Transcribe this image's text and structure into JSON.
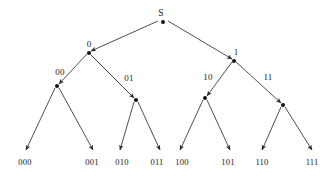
{
  "figure": {
    "name": "binary-prefix-code-tree",
    "background_color": "#ffffff",
    "stroke_color": "#3a3a3a",
    "text_color": "#1a1a1a"
  },
  "tree": {
    "root": {
      "id": "S",
      "label": "S",
      "label_x": 161,
      "label_y": 14,
      "x": 163,
      "y": 22
    },
    "internal_nodes": [
      {
        "id": "0",
        "label": "0",
        "label_x": 89,
        "label_y": 44,
        "x": 89,
        "y": 53
      },
      {
        "id": "1",
        "label": "1",
        "label_x": 236,
        "label_y": 52,
        "x": 234,
        "y": 61
      },
      {
        "id": "00",
        "label": "00",
        "label_x": 60,
        "label_y": 72,
        "x": 57,
        "y": 86
      },
      {
        "id": "01",
        "label": "01",
        "label_x": 129,
        "label_y": 78,
        "x": 136,
        "y": 100
      },
      {
        "id": "10",
        "label": "10",
        "label_x": 208,
        "label_y": 77,
        "x": 205,
        "y": 98
      },
      {
        "id": "11",
        "label": "11",
        "label_x": 268,
        "label_y": 77,
        "x": 283,
        "y": 105
      }
    ],
    "leaves": [
      {
        "id": "000",
        "label": "000",
        "label_x": 25,
        "label_y": 162,
        "tip_x": 26,
        "tip_y": 150
      },
      {
        "id": "001",
        "label": "001",
        "label_x": 92,
        "label_y": 162,
        "tip_x": 93,
        "tip_y": 150
      },
      {
        "id": "010",
        "label": "010",
        "label_x": 122,
        "label_y": 162,
        "tip_x": 120,
        "tip_y": 150
      },
      {
        "id": "011",
        "label": "011",
        "label_x": 157,
        "label_y": 162,
        "tip_x": 160,
        "tip_y": 150
      },
      {
        "id": "100",
        "label": "100",
        "label_x": 182,
        "label_y": 162,
        "tip_x": 180,
        "tip_y": 150
      },
      {
        "id": "101",
        "label": "101",
        "label_x": 228,
        "label_y": 162,
        "tip_x": 230,
        "tip_y": 150
      },
      {
        "id": "110",
        "label": "110",
        "label_x": 262,
        "label_y": 162,
        "tip_x": 262,
        "tip_y": 150
      },
      {
        "id": "111",
        "label": "111",
        "label_x": 312,
        "label_y": 162,
        "tip_x": 312,
        "tip_y": 150
      }
    ],
    "edges": [
      {
        "from": "S",
        "to": "0",
        "x1": 158,
        "y1": 21,
        "x2": 91,
        "y2": 51,
        "arrow": true
      },
      {
        "from": "S",
        "to": "1",
        "x1": 168,
        "y1": 21,
        "x2": 232,
        "y2": 59,
        "arrow": true
      },
      {
        "from": "0",
        "to": "00",
        "x1": 87,
        "y1": 54,
        "x2": 59,
        "y2": 84,
        "arrow": true
      },
      {
        "from": "0",
        "to": "01",
        "x1": 91,
        "y1": 55,
        "x2": 134,
        "y2": 98,
        "arrow": true
      },
      {
        "from": "1",
        "to": "10",
        "x1": 232,
        "y1": 62,
        "x2": 207,
        "y2": 96,
        "arrow": true
      },
      {
        "from": "1",
        "to": "11",
        "x1": 236,
        "y1": 62,
        "x2": 281,
        "y2": 103,
        "arrow": true
      },
      {
        "from": "00",
        "to": "000",
        "x1": 55,
        "y1": 88,
        "x2": 26,
        "y2": 150,
        "arrow": true
      },
      {
        "from": "00",
        "to": "001",
        "x1": 59,
        "y1": 88,
        "x2": 93,
        "y2": 150,
        "arrow": true
      },
      {
        "from": "01",
        "to": "010",
        "x1": 134,
        "y1": 102,
        "x2": 120,
        "y2": 150,
        "arrow": true
      },
      {
        "from": "01",
        "to": "011",
        "x1": 138,
        "y1": 102,
        "x2": 160,
        "y2": 150,
        "arrow": true
      },
      {
        "from": "10",
        "to": "100",
        "x1": 203,
        "y1": 100,
        "x2": 180,
        "y2": 150,
        "arrow": true
      },
      {
        "from": "10",
        "to": "101",
        "x1": 207,
        "y1": 100,
        "x2": 230,
        "y2": 150,
        "arrow": true
      },
      {
        "from": "11",
        "to": "110",
        "x1": 281,
        "y1": 107,
        "x2": 262,
        "y2": 150,
        "arrow": true
      },
      {
        "from": "11",
        "to": "111",
        "x1": 285,
        "y1": 107,
        "x2": 312,
        "y2": 150,
        "arrow": true
      }
    ]
  }
}
